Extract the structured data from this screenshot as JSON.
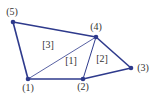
{
  "diagram": {
    "type": "finite-element-mesh",
    "edge_color": "#2e3a8c",
    "nodes": [
      {
        "id": 1,
        "label": "(1)",
        "x": 28,
        "y": 79,
        "lx": 28,
        "ly": 91
      },
      {
        "id": 2,
        "label": "(2)",
        "x": 83,
        "y": 79,
        "lx": 83,
        "ly": 90
      },
      {
        "id": 3,
        "label": "(3)",
        "x": 131,
        "y": 68,
        "lx": 143,
        "ly": 71
      },
      {
        "id": 4,
        "label": "(4)",
        "x": 96,
        "y": 37,
        "lx": 96,
        "ly": 30
      },
      {
        "id": 5,
        "label": "(5)",
        "x": 13,
        "y": 22,
        "lx": 12,
        "ly": 15
      }
    ],
    "elements": [
      {
        "id": 1,
        "label": "[1]",
        "x": 71,
        "y": 64
      },
      {
        "id": 2,
        "label": "[2]",
        "x": 102,
        "y": 62
      },
      {
        "id": 3,
        "label": "[3]",
        "x": 48,
        "y": 48
      }
    ],
    "edges": [
      {
        "from": 5,
        "to": 4,
        "w": 1.6
      },
      {
        "from": 5,
        "to": 1,
        "w": 1.6
      },
      {
        "from": 1,
        "to": 2,
        "w": 1.6
      },
      {
        "from": 2,
        "to": 3,
        "w": 1.6
      },
      {
        "from": 3,
        "to": 4,
        "w": 1.6
      },
      {
        "from": 2,
        "to": 4,
        "w": 1.0
      },
      {
        "from": 1,
        "to": 4,
        "w": 0.8
      }
    ]
  }
}
